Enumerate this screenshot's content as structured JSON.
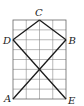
{
  "diagram": {
    "type": "grid-geometry",
    "grid": {
      "columns": 4,
      "rows": 8
    },
    "points": {
      "A": {
        "label": "A",
        "grid": [
          0,
          0
        ]
      },
      "E": {
        "label": "E",
        "grid": [
          4,
          0
        ]
      },
      "B": {
        "label": "B",
        "grid": [
          4,
          6
        ]
      },
      "C": {
        "label": "C",
        "grid": [
          2,
          8
        ]
      },
      "D": {
        "label": "D",
        "grid": [
          0,
          6
        ]
      }
    },
    "segments": [
      [
        "D",
        "C"
      ],
      [
        "C",
        "B"
      ],
      [
        "D",
        "E"
      ],
      [
        "B",
        "A"
      ]
    ],
    "colors": {
      "lines": "#1a1a1a",
      "grid": "#8a8a8a"
    }
  }
}
